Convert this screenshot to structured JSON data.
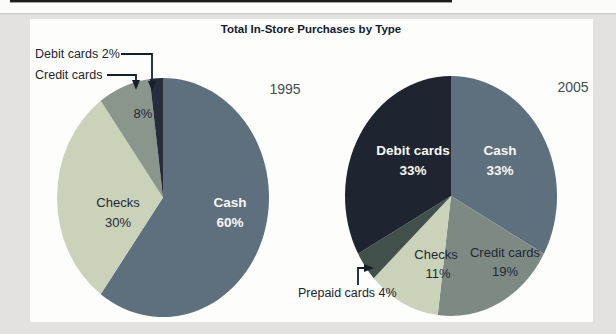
{
  "page": {
    "background_color": "#e3e2de",
    "panel_color": "#fdfdfb",
    "top_rule_color": "#c9c8c4",
    "top_accent_color": "#1c1c1a",
    "title_color": "#13202e",
    "dark_text_color": "#1f2836",
    "white_text_color": "#f8f8f4",
    "year_text_color": "#424c56"
  },
  "title": "Total In-Store Purchases by Type",
  "chart_data": [
    {
      "type": "pie",
      "year": "1995",
      "title": "Total In-Store Purchases by Type",
      "direction": "clockwise",
      "start_angle_deg": 0,
      "slices": [
        {
          "label": "Cash",
          "value": 60,
          "pct": "60%",
          "color": "#5e707d",
          "label_color": "#f8f8f4",
          "label_placement": "inside"
        },
        {
          "label": "Checks",
          "value": 30,
          "pct": "30%",
          "color": "#cbd2ba",
          "label_color": "#1f2836",
          "label_placement": "inside"
        },
        {
          "label": "Credit cards",
          "value": 8,
          "pct": "8%",
          "color": "#8a958c",
          "label_color": "#1f2836",
          "label_placement": "inside-pct-plus-callout"
        },
        {
          "label": "Debit cards",
          "value": 2,
          "pct": "2%",
          "color": "#242d3a",
          "label_color": "#1f2836",
          "label_placement": "callout"
        }
      ],
      "callouts": [
        {
          "text": "Debit cards 2%"
        },
        {
          "text": "Credit cards"
        }
      ]
    },
    {
      "type": "pie",
      "year": "2005",
      "title": "Total In-Store Purchases by Type",
      "direction": "clockwise",
      "start_angle_deg": 0,
      "slices": [
        {
          "label": "Cash",
          "value": 33,
          "pct": "33%",
          "color": "#5e707d",
          "label_color": "#f8f8f4",
          "label_placement": "inside"
        },
        {
          "label": "Credit cards",
          "value": 19,
          "pct": "19%",
          "color": "#7d8a83",
          "label_color": "#1f2836",
          "label_placement": "inside"
        },
        {
          "label": "Checks",
          "value": 11,
          "pct": "11%",
          "color": "#cbd2ba",
          "label_color": "#1f2836",
          "label_placement": "inside"
        },
        {
          "label": "Prepaid cards",
          "value": 4,
          "pct": "4%",
          "color": "#41504a",
          "label_color": "#1f2836",
          "label_placement": "callout"
        },
        {
          "label": "Debit cards",
          "value": 33,
          "pct": "33%",
          "color": "#1e2430",
          "label_color": "#f8f8f4",
          "label_placement": "inside"
        }
      ],
      "callouts": [
        {
          "text": "Prepaid cards 4%"
        }
      ]
    }
  ]
}
